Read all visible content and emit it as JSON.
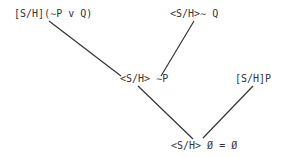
{
  "nodes": [
    {
      "id": "n1",
      "label": "[S/H](∼P v Q)"
    },
    {
      "id": "n2",
      "label": "<S/H>∼ Q"
    },
    {
      "id": "n3",
      "label": "<S/H> ∼P"
    },
    {
      "id": "n4",
      "label": "[S/H]P"
    },
    {
      "id": "n5",
      "label": "<S/H> Ø = Ø"
    }
  ],
  "edges": [
    {
      "from": "n1",
      "to": "n3"
    },
    {
      "from": "n2",
      "to": "n3"
    },
    {
      "from": "n3",
      "to": "n5"
    },
    {
      "from": "n4",
      "to": "n5"
    }
  ]
}
